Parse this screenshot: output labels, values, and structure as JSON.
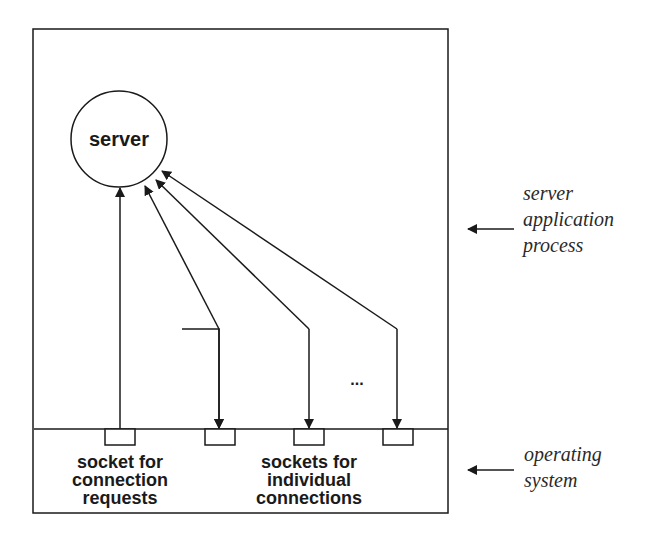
{
  "diagram": {
    "server_label": "server",
    "ellipsis": "...",
    "socket_listen_label": [
      "socket for",
      "connection",
      "requests"
    ],
    "socket_conn_label": [
      "sockets for",
      "individual",
      "connections"
    ],
    "layer_app_label": [
      "server",
      "application",
      "process"
    ],
    "layer_os_label": [
      "operating",
      "system"
    ],
    "stroke_color": "#1a1a1a",
    "background": "#ffffff"
  }
}
